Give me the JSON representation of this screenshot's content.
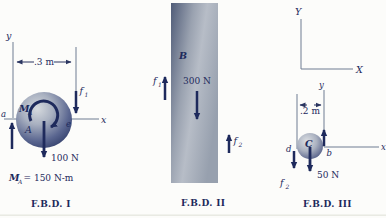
{
  "figure_type": "free-body-diagram set",
  "colors": {
    "ink_navy": "#1e2a5c",
    "axis_gray": "#6e7c92",
    "ball_light": "#d6dade",
    "ball_dark": "#2e3a66",
    "plate_dark": "#505c78",
    "plate_light": "#b7bdc7",
    "background": "#fcfcfa"
  },
  "fbd1": {
    "caption": "F.B.D. I",
    "y_label": "y",
    "x_label": "x",
    "dimension": ".3 m",
    "point_a": "a",
    "point_e": "e",
    "body_label": "A",
    "moment_symbol": "M",
    "moment_subscript": "A",
    "f1_symbol": "f",
    "f1_subscript": "1",
    "weight_force": "100 N",
    "equation_symbol": "M",
    "equation_subscript": "A",
    "equation_value": "= 150 N-m"
  },
  "fbd2": {
    "caption": "F.B.D. II",
    "body_label": "B",
    "applied_force": "300 N",
    "f1_symbol": "f",
    "f1_subscript": "1",
    "f2_symbol": "f",
    "f2_subscript": "2"
  },
  "fbd3": {
    "caption": "F.B.D. III",
    "global_y_label": "Y",
    "global_x_label": "X",
    "y_label": "y",
    "x_label": "x",
    "dimension": ".2 m",
    "body_label": "C",
    "point_b": "b",
    "point_d": "d",
    "f2_symbol": "f",
    "f2_subscript": "2",
    "weight_force": "50 N"
  }
}
